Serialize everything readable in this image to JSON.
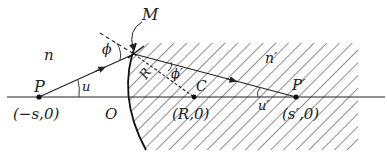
{
  "diagram": {
    "media": {
      "left_index": "n",
      "right_index": "n′"
    },
    "points": {
      "object": {
        "label": "P",
        "coord": "(−s,0)"
      },
      "vertex": {
        "label": "O"
      },
      "center": {
        "label": "C",
        "coord": "(R,0)"
      },
      "image": {
        "label": "P′",
        "coord": "(s′,0)"
      },
      "incidence": {
        "label": "M"
      }
    },
    "angles": {
      "incidence": "ϕ",
      "refraction": "ϕ′",
      "object_ray": "u",
      "image_ray": "u′"
    },
    "radius_label": "R",
    "colors": {
      "ink": "#222222",
      "background": "#ffffff"
    }
  }
}
